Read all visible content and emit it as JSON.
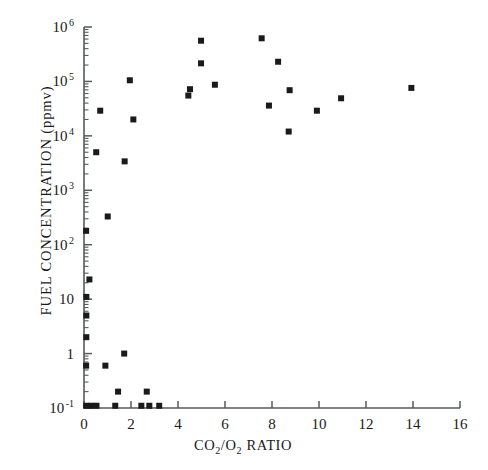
{
  "chart_data": {
    "type": "scatter",
    "title": "",
    "xlabel": "CO2/O2  RATIO",
    "xlabel_display": "CO₂/O₂  RATIO",
    "ylabel": "FUEL CONCENTRATION  (ppmv)",
    "xlim": [
      0,
      16
    ],
    "ylim": [
      0.1,
      1000000
    ],
    "yscale": "log",
    "xscale": "linear",
    "grid": false,
    "legend": null,
    "xticks": [
      0,
      2,
      4,
      6,
      8,
      10,
      12,
      14,
      16
    ],
    "xticklabels": [
      "0",
      "2",
      "4",
      "6",
      "8",
      "10",
      "12",
      "14",
      "16"
    ],
    "yticks": [
      0.1,
      1,
      10,
      100,
      1000,
      10000,
      100000,
      1000000
    ],
    "yticklabels": [
      "10 -1",
      "1",
      "10",
      "10 2",
      "10 3",
      "10 4",
      "10 5",
      "10 6"
    ],
    "marker": "square",
    "marker_color": "#1a1a1a",
    "marker_size_px": 6,
    "series": [
      {
        "name": "fuel concentration vs CO2/O2 ratio",
        "points": [
          {
            "x": 0.09,
            "y": 0.11
          },
          {
            "x": 0.31,
            "y": 0.11
          },
          {
            "x": 0.53,
            "y": 0.11
          },
          {
            "x": 1.33,
            "y": 0.11
          },
          {
            "x": 2.44,
            "y": 0.11
          },
          {
            "x": 2.78,
            "y": 0.11
          },
          {
            "x": 3.2,
            "y": 0.11
          },
          {
            "x": 1.45,
            "y": 0.2
          },
          {
            "x": 2.67,
            "y": 0.2
          },
          {
            "x": 0.09,
            "y": 0.6
          },
          {
            "x": 0.91,
            "y": 0.6
          },
          {
            "x": 1.71,
            "y": 1.0
          },
          {
            "x": 0.1,
            "y": 2.0
          },
          {
            "x": 0.1,
            "y": 5.0
          },
          {
            "x": 0.1,
            "y": 11.0
          },
          {
            "x": 0.23,
            "y": 23.0
          },
          {
            "x": 0.09,
            "y": 180.0
          },
          {
            "x": 1.01,
            "y": 330.0
          },
          {
            "x": 1.73,
            "y": 3400.0
          },
          {
            "x": 0.52,
            "y": 5000.0
          },
          {
            "x": 8.71,
            "y": 12000.0
          },
          {
            "x": 2.1,
            "y": 20000.0
          },
          {
            "x": 0.69,
            "y": 29000.0
          },
          {
            "x": 9.91,
            "y": 29000.0
          },
          {
            "x": 7.87,
            "y": 36000.0
          },
          {
            "x": 10.94,
            "y": 49000.0
          },
          {
            "x": 4.44,
            "y": 55000.0
          },
          {
            "x": 8.75,
            "y": 69000.0
          },
          {
            "x": 4.51,
            "y": 72000.0
          },
          {
            "x": 13.93,
            "y": 76000.0
          },
          {
            "x": 5.57,
            "y": 87000.0
          },
          {
            "x": 1.95,
            "y": 105000.0
          },
          {
            "x": 8.26,
            "y": 230000.0
          },
          {
            "x": 4.98,
            "y": 215000.0
          },
          {
            "x": 4.98,
            "y": 560000.0
          },
          {
            "x": 7.56,
            "y": 620000.0
          }
        ]
      }
    ]
  },
  "axes": {
    "x_title_main": "CO",
    "x_title_sub1": "2",
    "x_title_mid": "/O",
    "x_title_sub2": "2",
    "x_title_tail": "  RATIO",
    "y_title": "FUEL CONCENTRATION  (ppmv)"
  }
}
